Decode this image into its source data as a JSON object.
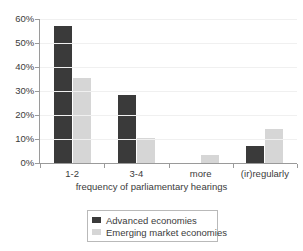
{
  "chart_data": {
    "type": "bar",
    "title": "",
    "subtitle": "",
    "xlabel": "frequency of parliamentary hearings",
    "ylabel": "",
    "categories": [
      "1-2",
      "3-4",
      "more",
      "(ir)regularly"
    ],
    "series": [
      {
        "name": "Advanced economies",
        "color": "#3a3a3a",
        "values": [
          57,
          28.5,
          0,
          7
        ]
      },
      {
        "name": "Emerging market economies",
        "color": "#d6d6d6",
        "values": [
          35.5,
          10.5,
          3.5,
          14
        ]
      }
    ],
    "ylim": [
      0,
      60
    ],
    "yticks": [
      0,
      10,
      20,
      30,
      40,
      50,
      60
    ],
    "ytick_labels": [
      "0%",
      "10%",
      "20%",
      "30%",
      "40%",
      "50%",
      "60%"
    ],
    "grid": true,
    "grid_axis": "y",
    "legend_position": "bottom",
    "value_suffix": "%"
  },
  "axis": {
    "line_color": "#9a9a9a",
    "grid_color": "#f0f0f0"
  }
}
